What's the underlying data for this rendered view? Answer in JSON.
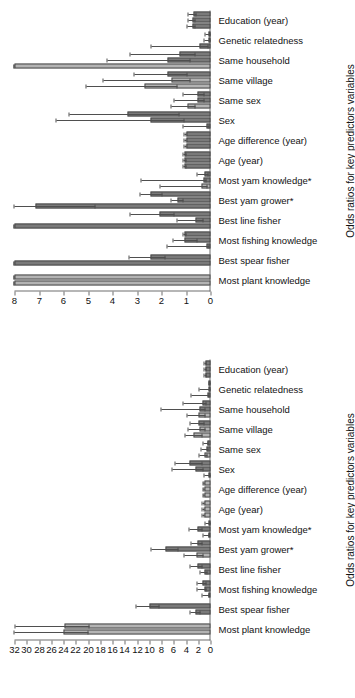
{
  "figure": {
    "orientation": "rotated-90",
    "panel_count": 2,
    "bar_fill_light": "#b3b3b3",
    "bar_fill_dark": "#7a7a7a",
    "bar_edge": "#4a4a4a",
    "error_bar_color": "#4f4f4f",
    "axis_color": "#6e6e6e"
  },
  "categories": [
    "Most plant knowledge",
    "Best spear fisher",
    "Most fishing knowledge",
    "Best line fisher",
    "Best yam grower*",
    "Most yam knowledge*",
    "Age (year)",
    "Age difference (year)",
    "Sex",
    "Same sex",
    "Same village",
    "Same household",
    "Genetic relatedness",
    "Education (year)"
  ],
  "chart_data": [
    {
      "id": "panel-a",
      "position_in_screenshot": "upper",
      "type": "bar",
      "title": "",
      "xlabel": "",
      "ylabel": "Odds ratios for key predictors variables",
      "axis_title": "Odds ratios for key predictors variables",
      "ylim": [
        0,
        8
      ],
      "yticks": [
        0,
        1,
        2,
        3,
        4,
        5,
        6,
        7,
        8
      ],
      "ytick_labels": [
        "0",
        "1",
        "2",
        "3",
        "4",
        "5",
        "6",
        "7",
        "8"
      ],
      "grid": false,
      "legend": "none",
      "categories": [
        "Most plant knowledge",
        "Best spear fisher",
        "Most fishing knowledge",
        "Best line fisher",
        "Best yam grower*",
        "Most yam knowledge*",
        "Age (year)",
        "Age difference (year)",
        "Sex",
        "Same sex",
        "Same village",
        "Same household",
        "Genetic relatedness",
        "Education (year)"
      ],
      "groups": [
        {
          "category": "Most plant knowledge",
          "bars": [
            {
              "value": 8.0,
              "lo": 8.0,
              "hi": 8.0,
              "shade": "light",
              "clipped": true
            },
            {
              "value": 8.0,
              "lo": 8.0,
              "hi": 8.0,
              "shade": "light",
              "clipped": true
            }
          ]
        },
        {
          "category": "Best spear fisher",
          "bars": [
            {
              "value": 8.0,
              "lo": 8.0,
              "hi": 8.0,
              "shade": "dark",
              "clipped": true
            },
            {
              "value": 2.45,
              "lo": 1.85,
              "hi": 3.3,
              "shade": "dark",
              "clipped": false
            }
          ]
        },
        {
          "category": "Most fishing knowledge",
          "bars": [
            {
              "value": 0.18,
              "lo": 0.05,
              "hi": 1.75,
              "shade": "dark",
              "clipped": false
            },
            {
              "value": 1.05,
              "lo": 0.55,
              "hi": 1.5,
              "shade": "dark",
              "clipped": false
            },
            {
              "value": 1.05,
              "lo": 1.0,
              "hi": 1.1,
              "shade": "dark",
              "clipped": false
            }
          ]
        },
        {
          "category": "Best line fisher",
          "bars": [
            {
              "value": 8.0,
              "lo": 8.0,
              "hi": 8.0,
              "shade": "dark",
              "clipped": true
            },
            {
              "value": 0.6,
              "lo": 0.3,
              "hi": 1.35,
              "shade": "dark",
              "clipped": false
            },
            {
              "value": 2.1,
              "lo": 1.45,
              "hi": 3.25,
              "shade": "dark",
              "clipped": false
            }
          ]
        },
        {
          "category": "Best yam grower*",
          "bars": [
            {
              "value": 7.15,
              "lo": 4.7,
              "hi": 8.0,
              "shade": "dark",
              "clipped": false
            },
            {
              "value": 1.35,
              "lo": 1.1,
              "hi": 1.6,
              "shade": "dark",
              "clipped": false
            },
            {
              "value": 2.45,
              "lo": 1.95,
              "hi": 2.85,
              "shade": "dark",
              "clipped": false
            }
          ]
        },
        {
          "category": "Most yam knowledge*",
          "bars": [
            {
              "value": 0.35,
              "lo": 0.12,
              "hi": 2.05,
              "shade": "light",
              "clipped": false
            },
            {
              "value": 0.3,
              "lo": 0.15,
              "hi": 2.8,
              "shade": "dark",
              "clipped": false
            },
            {
              "value": 0.25,
              "lo": 0.1,
              "hi": 0.55,
              "shade": "dark",
              "clipped": false
            }
          ]
        },
        {
          "category": "Age (year)",
          "bars": [
            {
              "value": 1.05,
              "lo": 1.0,
              "hi": 1.12,
              "shade": "dark",
              "clipped": false
            },
            {
              "value": 1.05,
              "lo": 1.0,
              "hi": 1.12,
              "shade": "dark",
              "clipped": false
            },
            {
              "value": 1.05,
              "lo": 1.0,
              "hi": 1.1,
              "shade": "dark",
              "clipped": false
            }
          ]
        },
        {
          "category": "Age difference (year)",
          "bars": [
            {
              "value": 1.0,
              "lo": 0.97,
              "hi": 1.05,
              "shade": "dark",
              "clipped": false
            },
            {
              "value": 1.0,
              "lo": 0.97,
              "hi": 1.05,
              "shade": "dark",
              "clipped": false
            },
            {
              "value": 1.0,
              "lo": 0.97,
              "hi": 1.05,
              "shade": "dark",
              "clipped": false
            }
          ]
        },
        {
          "category": "Sex",
          "bars": [
            {
              "value": 0.18,
              "lo": 0.05,
              "hi": 1.1,
              "shade": "dark",
              "clipped": false
            },
            {
              "value": 2.45,
              "lo": 1.05,
              "hi": 6.3,
              "shade": "dark",
              "clipped": false
            },
            {
              "value": 3.4,
              "lo": 1.25,
              "hi": 5.75,
              "shade": "dark",
              "clipped": false
            }
          ]
        },
        {
          "category": "Same sex",
          "bars": [
            {
              "value": 0.95,
              "lo": 0.6,
              "hi": 1.6,
              "shade": "light",
              "clipped": false
            },
            {
              "value": 0.55,
              "lo": 0.25,
              "hi": 1.45,
              "shade": "dark",
              "clipped": false
            },
            {
              "value": 0.55,
              "lo": 0.25,
              "hi": 1.1,
              "shade": "dark",
              "clipped": false
            }
          ]
        },
        {
          "category": "Same village",
          "bars": [
            {
              "value": 2.7,
              "lo": 1.35,
              "hi": 5.05,
              "shade": "light",
              "clipped": false
            },
            {
              "value": 1.6,
              "lo": 0.8,
              "hi": 4.35,
              "shade": "light",
              "clipped": false
            },
            {
              "value": 1.75,
              "lo": 0.95,
              "hi": 3.1,
              "shade": "dark",
              "clipped": false
            }
          ]
        },
        {
          "category": "Same household",
          "bars": [
            {
              "value": 8.0,
              "lo": 8.0,
              "hi": 8.0,
              "shade": "light",
              "clipped": true
            },
            {
              "value": 1.75,
              "lo": 0.8,
              "hi": 4.2,
              "shade": "dark",
              "clipped": false
            },
            {
              "value": 1.25,
              "lo": 0.6,
              "hi": 3.25,
              "shade": "dark",
              "clipped": false
            }
          ]
        },
        {
          "category": "Genetic relatedness",
          "bars": [
            {
              "value": 0.45,
              "lo": 0.1,
              "hi": 2.4,
              "shade": "dark",
              "clipped": false
            },
            {
              "value": 0.1,
              "lo": 0.02,
              "hi": 0.25,
              "shade": "dark",
              "clipped": false
            },
            {
              "value": 0.08,
              "lo": 0.02,
              "hi": 0.2,
              "shade": "dark",
              "clipped": false
            }
          ]
        },
        {
          "category": "Education (year)",
          "bars": [
            {
              "value": 0.75,
              "lo": 0.62,
              "hi": 0.95,
              "shade": "dark",
              "clipped": false
            },
            {
              "value": 0.72,
              "lo": 0.6,
              "hi": 0.9,
              "shade": "dark",
              "clipped": false
            },
            {
              "value": 0.7,
              "lo": 0.58,
              "hi": 0.88,
              "shade": "dark",
              "clipped": false
            }
          ]
        }
      ]
    },
    {
      "id": "panel-b",
      "position_in_screenshot": "lower",
      "type": "bar",
      "title": "",
      "xlabel": "",
      "ylabel": "Odds ratios for key predictors variables",
      "axis_title": "Odds ratios for key predictors variables",
      "ylim": [
        0,
        32
      ],
      "yticks": [
        0,
        2,
        4,
        6,
        8,
        10,
        12,
        14,
        16,
        18,
        20,
        22,
        24,
        26,
        28,
        30,
        32
      ],
      "ytick_labels": [
        "0",
        "2",
        "4",
        "6",
        "8",
        "10",
        "12",
        "14",
        "16",
        "18",
        "20",
        "22",
        "24",
        "26",
        "28",
        "30",
        "32"
      ],
      "grid": false,
      "legend": "none",
      "categories": [
        "Most plant knowledge",
        "Best spear fisher",
        "Most fishing knowledge",
        "Best line fisher",
        "Best yam grower*",
        "Most yam knowledge*",
        "Age (year)",
        "Age difference (year)",
        "Sex",
        "Same sex",
        "Same village",
        "Same household",
        "Genetic relatedness",
        "Education (year)"
      ],
      "groups": [
        {
          "category": "Most plant knowledge",
          "bars": [
            {
              "value": 24.0,
              "lo": 20.0,
              "hi": 32.0,
              "shade": "light",
              "clipped": false
            },
            {
              "value": 23.8,
              "lo": 19.8,
              "hi": 31.8,
              "shade": "light",
              "clipped": false
            }
          ]
        },
        {
          "category": "Best spear fisher",
          "bars": [
            {
              "value": 2.4,
              "lo": 1.6,
              "hi": 3.3,
              "shade": "dark",
              "clipped": false
            },
            {
              "value": 10.0,
              "lo": 8.4,
              "hi": 12.1,
              "shade": "dark",
              "clipped": false
            }
          ]
        },
        {
          "category": "Most fishing knowledge",
          "bars": [
            {
              "value": 0.3,
              "lo": 0.1,
              "hi": 1.35,
              "shade": "dark",
              "clipped": false
            },
            {
              "value": 1.05,
              "lo": 0.65,
              "hi": 2.05,
              "shade": "dark",
              "clipped": false
            },
            {
              "value": 1.25,
              "lo": 0.7,
              "hi": 2.15,
              "shade": "dark",
              "clipped": false
            }
          ]
        },
        {
          "category": "Best line fisher",
          "bars": [
            {
              "value": 1.05,
              "lo": 0.55,
              "hi": 1.65,
              "shade": "dark",
              "clipped": false
            },
            {
              "value": 2.2,
              "lo": 1.35,
              "hi": 3.3,
              "shade": "dark",
              "clipped": false
            }
          ]
        },
        {
          "category": "Best yam grower*",
          "bars": [
            {
              "value": 2.35,
              "lo": 1.15,
              "hi": 4.2,
              "shade": "light",
              "clipped": false
            },
            {
              "value": 7.35,
              "lo": 5.3,
              "hi": 9.7,
              "shade": "dark",
              "clipped": false
            },
            {
              "value": 2.1,
              "lo": 1.35,
              "hi": 3.1,
              "shade": "dark",
              "clipped": false
            }
          ]
        },
        {
          "category": "Most yam knowledge*",
          "bars": [
            {
              "value": 0.35,
              "lo": 0.1,
              "hi": 1.15,
              "shade": "dark",
              "clipped": false
            },
            {
              "value": 2.1,
              "lo": 1.25,
              "hi": 3.45,
              "shade": "dark",
              "clipped": false
            },
            {
              "value": 0.25,
              "lo": 0.08,
              "hi": 0.8,
              "shade": "dark",
              "clipped": false
            }
          ]
        },
        {
          "category": "Age (year)",
          "bars": [
            {
              "value": 1.05,
              "lo": 0.95,
              "hi": 1.25,
              "shade": "light",
              "clipped": false
            },
            {
              "value": 1.05,
              "lo": 0.95,
              "hi": 1.25,
              "shade": "light",
              "clipped": false
            },
            {
              "value": 1.05,
              "lo": 0.95,
              "hi": 1.25,
              "shade": "light",
              "clipped": false
            }
          ]
        },
        {
          "category": "Age difference (year)",
          "bars": [
            {
              "value": 1.0,
              "lo": 0.92,
              "hi": 1.18,
              "shade": "light",
              "clipped": false
            },
            {
              "value": 1.0,
              "lo": 0.92,
              "hi": 1.18,
              "shade": "light",
              "clipped": false
            },
            {
              "value": 1.0,
              "lo": 0.92,
              "hi": 1.18,
              "shade": "light",
              "clipped": false
            }
          ]
        },
        {
          "category": "Sex",
          "bars": [
            {
              "value": 0.25,
              "lo": 0.05,
              "hi": 0.95,
              "shade": "dark",
              "clipped": false
            },
            {
              "value": 2.45,
              "lo": 1.1,
              "hi": 6.2,
              "shade": "dark",
              "clipped": false
            },
            {
              "value": 3.45,
              "lo": 1.3,
              "hi": 5.7,
              "shade": "dark",
              "clipped": false
            }
          ]
        },
        {
          "category": "Same sex",
          "bars": [
            {
              "value": 0.95,
              "lo": 0.55,
              "hi": 1.85,
              "shade": "light",
              "clipped": false
            },
            {
              "value": 0.6,
              "lo": 0.25,
              "hi": 1.55,
              "shade": "dark",
              "clipped": false
            },
            {
              "value": 0.55,
              "lo": 0.25,
              "hi": 1.2,
              "shade": "dark",
              "clipped": false
            }
          ]
        },
        {
          "category": "Same village",
          "bars": [
            {
              "value": 2.75,
              "lo": 1.35,
              "hi": 4.15,
              "shade": "light",
              "clipped": false
            },
            {
              "value": 1.75,
              "lo": 0.85,
              "hi": 3.55,
              "shade": "light",
              "clipped": false
            },
            {
              "value": 1.9,
              "lo": 1.0,
              "hi": 3.25,
              "shade": "dark",
              "clipped": false
            }
          ]
        },
        {
          "category": "Same household",
          "bars": [
            {
              "value": 1.95,
              "lo": 0.85,
              "hi": 3.75,
              "shade": "light",
              "clipped": false
            },
            {
              "value": 1.8,
              "lo": 0.8,
              "hi": 8.0,
              "shade": "dark",
              "clipped": false
            },
            {
              "value": 1.35,
              "lo": 0.6,
              "hi": 4.4,
              "shade": "dark",
              "clipped": false
            }
          ]
        },
        {
          "category": "Genetic relatedness",
          "bars": [
            {
              "value": 0.5,
              "lo": 0.1,
              "hi": 3.1,
              "shade": "dark",
              "clipped": false
            },
            {
              "value": 0.1,
              "lo": 0.02,
              "hi": 1.85,
              "shade": "dark",
              "clipped": false
            },
            {
              "value": 0.08,
              "lo": 0.02,
              "hi": 0.2,
              "shade": "dark",
              "clipped": false
            }
          ]
        },
        {
          "category": "Education (year)",
          "bars": [
            {
              "value": 0.8,
              "lo": 0.65,
              "hi": 1.0,
              "shade": "dark",
              "clipped": false
            },
            {
              "value": 0.78,
              "lo": 0.62,
              "hi": 0.98,
              "shade": "dark",
              "clipped": false
            },
            {
              "value": 0.75,
              "lo": 0.6,
              "hi": 0.95,
              "shade": "dark",
              "clipped": false
            }
          ]
        }
      ]
    }
  ]
}
